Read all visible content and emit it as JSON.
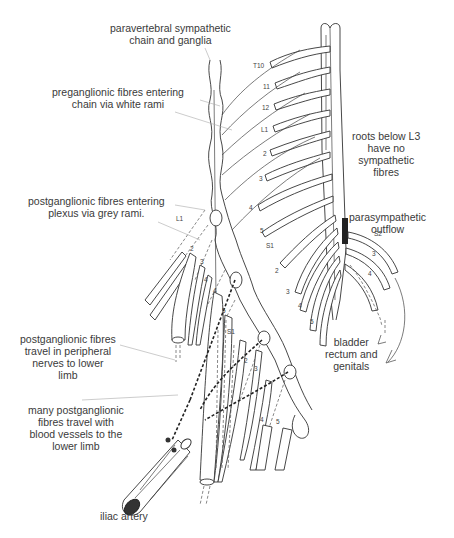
{
  "figure": {
    "labels": {
      "paravertebral_chain": [
        "paravertebral sympathetic",
        "chain and ganglia"
      ],
      "preganglionic_white_rami": [
        "preganglionic fibres entering",
        "chain via white rami"
      ],
      "postganglionic_grey_rami": [
        "postganglionic fibres entering",
        "plexus via grey rami."
      ],
      "postganglionic_peripheral": [
        "postganglionic fibres",
        "travel in peripheral",
        "nerves to lower",
        "limb"
      ],
      "postganglionic_blood_vessels": [
        "many postganglionic",
        "fibres travel with",
        "blood vessels to the",
        "lower limb"
      ],
      "iliac_artery": [
        "iliac artery"
      ],
      "roots_below_l3": [
        "roots below L3",
        "have no",
        "sympathetic",
        "fibres"
      ],
      "parasympathetic_outflow": [
        "parasympathetic",
        "outflow"
      ],
      "bladder": [
        "bladder",
        "rectum and",
        "genitals"
      ]
    },
    "spinal_root_labels": [
      "T10",
      "11",
      "12",
      "L1",
      "2",
      "3",
      "4",
      "5",
      "S1",
      "2",
      "3",
      "4",
      "5"
    ],
    "sacral_right_labels": [
      "S2",
      "3",
      "4"
    ],
    "plexus_labels": [
      "L1",
      "2",
      "3",
      "4",
      "4",
      "5",
      "S1",
      "2",
      "3",
      "4",
      "5"
    ]
  }
}
